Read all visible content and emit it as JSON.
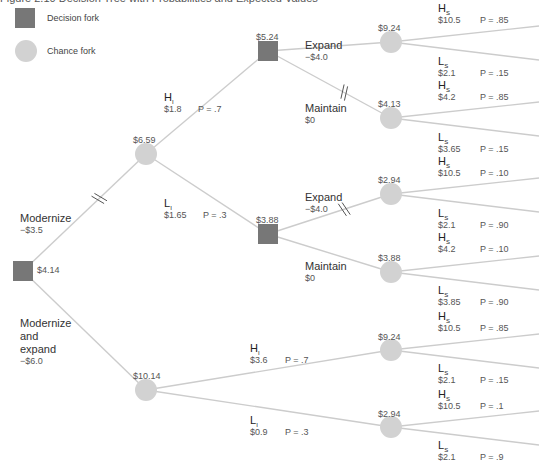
{
  "title": "Figure 2.10  Decision Tree with Probabilities and Expected Values",
  "legend": {
    "decision_label": "Decision fork",
    "chance_label": "Chance fork"
  },
  "colors": {
    "decision_node": "#777777",
    "chance_node": "#d2d2d2",
    "branch_line": "#cccccc",
    "text": "#444444"
  },
  "nodes": {
    "root": {
      "type": "decision",
      "value": "$4.14"
    },
    "chance_modernize": {
      "type": "chance",
      "value": "$6.59"
    },
    "decision_high_interim": {
      "type": "decision",
      "value": "$5.24"
    },
    "decision_low_interim": {
      "type": "decision",
      "value": "$3.88"
    },
    "chance_modernize_expand": {
      "type": "chance",
      "value": "$10.14"
    },
    "chance_hi_expand": {
      "type": "chance",
      "value": "$9.24"
    },
    "chance_hi_maintain": {
      "type": "chance",
      "value": "$4.13"
    },
    "chance_lo_expand": {
      "type": "chance",
      "value": "$2.94"
    },
    "chance_lo_maintain": {
      "type": "chance",
      "value": "$3.88"
    },
    "chance_me_high": {
      "type": "chance",
      "value": "$9.24"
    },
    "chance_me_low": {
      "type": "chance",
      "value": "$2.94"
    }
  },
  "branches": {
    "modernize": {
      "label": "Modernize",
      "cost": "−$3.5",
      "pruned": true
    },
    "modernize_expand": {
      "label_lines": [
        "Modernize",
        "and",
        "expand"
      ],
      "cost": "−$6.0"
    },
    "hi_m": {
      "state": "H",
      "sub": "I",
      "payoff": "$1.8",
      "prob": "P = .7"
    },
    "lo_m": {
      "state": "L",
      "sub": "I",
      "payoff": "$1.65",
      "prob": "P = .3"
    },
    "hi_expand": {
      "label": "Expand",
      "cost": "−$4.0"
    },
    "hi_maintain": {
      "label": "Maintain",
      "cost": "$0",
      "pruned": true
    },
    "lo_expand": {
      "label": "Expand",
      "cost": "−$4.0",
      "pruned": true
    },
    "lo_maintain": {
      "label": "Maintain",
      "cost": "$0"
    },
    "hi_me": {
      "state": "H",
      "sub": "I",
      "payoff": "$3.6",
      "prob": "P = .7"
    },
    "lo_me": {
      "state": "L",
      "sub": "I",
      "payoff": "$0.9",
      "prob": "P = .3"
    }
  },
  "outcomes": [
    {
      "state": "H",
      "sub": "S",
      "payoff": "$10.5",
      "prob": "P = .85"
    },
    {
      "state": "L",
      "sub": "S",
      "payoff": "$2.1",
      "prob": "P = .15"
    },
    {
      "state": "H",
      "sub": "S",
      "payoff": "$4.2",
      "prob": "P = .85"
    },
    {
      "state": "L",
      "sub": "S",
      "payoff": "$3.65",
      "prob": "P = .15"
    },
    {
      "state": "H",
      "sub": "S",
      "payoff": "$10.5",
      "prob": "P = .10"
    },
    {
      "state": "L",
      "sub": "S",
      "payoff": "$2.1",
      "prob": "P = .90"
    },
    {
      "state": "H",
      "sub": "S",
      "payoff": "$4.2",
      "prob": "P = .10"
    },
    {
      "state": "L",
      "sub": "S",
      "payoff": "$3.85",
      "prob": "P = .90"
    },
    {
      "state": "H",
      "sub": "S",
      "payoff": "$10.5",
      "prob": "P = .85"
    },
    {
      "state": "L",
      "sub": "S",
      "payoff": "$2.1",
      "prob": "P = .15"
    },
    {
      "state": "H",
      "sub": "S",
      "payoff": "$10.5",
      "prob": "P = .1"
    },
    {
      "state": "L",
      "sub": "S",
      "payoff": "$2.1",
      "prob": "P = .9"
    }
  ]
}
